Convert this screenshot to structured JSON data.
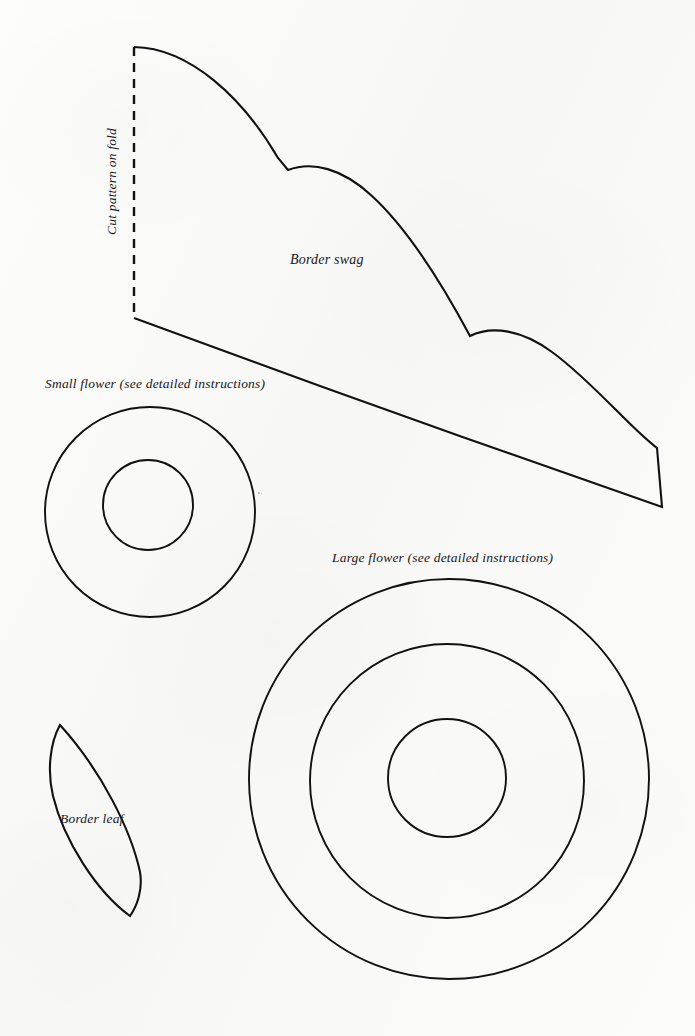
{
  "page": {
    "kind": "craft-pattern-sheet",
    "background_color": "#fbfbfa",
    "ink_color": "#111114",
    "width": 695,
    "height": 1036
  },
  "labels": {
    "fold": "Cut pattern on fold",
    "border_swag": "Border swag",
    "small_flower": "Small flower (see detailed instructions)",
    "large_flower": "Large flower (see detailed instructions)",
    "border_leaf": "Border leaf"
  },
  "shapes": {
    "border_swag": {
      "name": "Border swag",
      "fold_edge": "left",
      "fold_line": {
        "x": 134,
        "y_top": 47,
        "y_bottom": 318,
        "style": "dashed"
      },
      "outline_path": "M 134 47 C 196 47 252 104 288 170 C 318 163 360 176 400 222 C 430 257 455 300 470 336 C 505 325 556 339 600 396 C 626 429 648 450 657 449 L 662 507 L 134 318 Z",
      "top_scallops": 3,
      "bottom_edge": "single sweeping curve from fold bottom to right tip",
      "right_tip": {
        "x": 662,
        "y": 507
      }
    },
    "small_flower": {
      "name": "Small flower",
      "circles": [
        {
          "cx": 150,
          "cy": 512,
          "r": 105,
          "role": "outer"
        },
        {
          "cx": 148,
          "cy": 505,
          "r": 45,
          "role": "center"
        }
      ]
    },
    "large_flower": {
      "name": "Large flower",
      "circles": [
        {
          "cx": 449,
          "cy": 779,
          "r": 200,
          "role": "outer"
        },
        {
          "cx": 447,
          "cy": 781,
          "r": 137,
          "role": "middle"
        },
        {
          "cx": 447,
          "cy": 778,
          "r": 59,
          "role": "center"
        }
      ]
    },
    "border_leaf": {
      "name": "Border leaf",
      "tip_top": {
        "x": 60,
        "y": 725
      },
      "tip_bottom": {
        "x": 130,
        "y": 916
      },
      "outline_path": "M 60 725 C 100 768 130 835 140 876 C 142 892 136 906 130 916 C 96 893 62 840 51 794 C 47 772 50 744 60 725 Z"
    }
  },
  "marks": {
    "specks": [
      {
        "x": 258,
        "y": 492,
        "size": 2
      },
      {
        "x": 261,
        "y": 493,
        "size": 1
      }
    ]
  }
}
